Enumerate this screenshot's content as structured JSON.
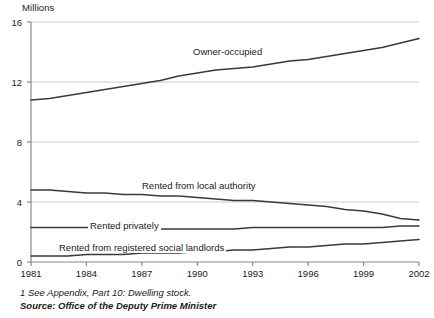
{
  "chart_data": {
    "type": "line",
    "title": "",
    "subtitle": "",
    "ylabel": "Millions",
    "xlabel": "",
    "ylim": [
      0,
      16
    ],
    "xlim": [
      1981,
      2002
    ],
    "grid": true,
    "legend_position": "inline-labels",
    "ytick_labels": [
      "0",
      "4",
      "8",
      "12",
      "16"
    ],
    "ytick_values": [
      0,
      4,
      8,
      12,
      16
    ],
    "xtick_labels": [
      "1981",
      "1984",
      "1987",
      "1990",
      "1993",
      "1996",
      "1999",
      "2002"
    ],
    "xtick_values": [
      1981,
      1984,
      1987,
      1990,
      1993,
      1996,
      1999,
      2002
    ],
    "x": [
      1981,
      1982,
      1983,
      1984,
      1985,
      1986,
      1987,
      1988,
      1989,
      1990,
      1991,
      1992,
      1993,
      1994,
      1995,
      1996,
      1997,
      1998,
      1999,
      2000,
      2001,
      2002
    ],
    "series": [
      {
        "name": "Owner-occupied",
        "label": "Owner-occupied",
        "color": "#3a3a3a",
        "values": [
          10.8,
          10.9,
          11.1,
          11.3,
          11.5,
          11.7,
          11.9,
          12.1,
          12.4,
          12.6,
          12.8,
          12.9,
          13.0,
          13.2,
          13.4,
          13.5,
          13.7,
          13.9,
          14.1,
          14.3,
          14.6,
          14.9
        ]
      },
      {
        "name": "Rented from local authority",
        "label": "Rented from local authority",
        "color": "#3a3a3a",
        "values": [
          4.8,
          4.8,
          4.7,
          4.6,
          4.6,
          4.5,
          4.5,
          4.4,
          4.4,
          4.3,
          4.2,
          4.1,
          4.1,
          4.0,
          3.9,
          3.8,
          3.7,
          3.5,
          3.4,
          3.2,
          2.9,
          2.8
        ]
      },
      {
        "name": "Rented privately",
        "label": "Rented privately",
        "color": "#3a3a3a",
        "values": [
          2.3,
          2.3,
          2.3,
          2.3,
          2.3,
          2.2,
          2.2,
          2.2,
          2.2,
          2.2,
          2.2,
          2.2,
          2.3,
          2.3,
          2.3,
          2.3,
          2.3,
          2.3,
          2.3,
          2.3,
          2.4,
          2.4
        ]
      },
      {
        "name": "Rented from registered social landlords",
        "label": "Rented from registered social landlords",
        "color": "#3a3a3a",
        "values": [
          0.4,
          0.4,
          0.4,
          0.5,
          0.5,
          0.5,
          0.6,
          0.6,
          0.6,
          0.7,
          0.7,
          0.8,
          0.8,
          0.9,
          1.0,
          1.0,
          1.1,
          1.2,
          1.2,
          1.3,
          1.4,
          1.5
        ]
      }
    ],
    "annotations": [
      "1 See Appendix, Part 10: Dwelling stock.",
      "Source: Office of the Deputy Prime Minister"
    ]
  },
  "footer": {
    "note": "1 See Appendix, Part 10: Dwelling stock.",
    "source": "Source: Office of the Deputy Prime Minister"
  },
  "colors": {
    "line": "#3a3a3a",
    "grid": "#cccccc",
    "axis": "#8a8a8a",
    "text": "#1a1a1a",
    "background": "#ffffff"
  }
}
